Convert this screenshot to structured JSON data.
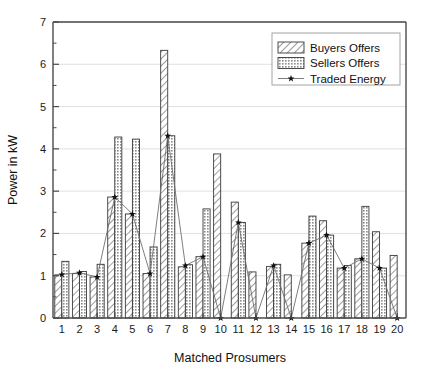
{
  "chart_data": {
    "type": "bar",
    "title": "",
    "subtitle": "",
    "xlabel": "Matched Prosumers",
    "ylabel": "Power in kW",
    "xlim": [
      0.4,
      20.6
    ],
    "ylim": [
      0,
      7
    ],
    "yticks": [
      0,
      1,
      2,
      3,
      4,
      5,
      6,
      7
    ],
    "ytick_labels": [
      "0",
      "1",
      "2",
      "3",
      "4",
      "5",
      "6",
      "7"
    ],
    "ytick_minor_step": 0.5,
    "grid": "horizontal-major-light",
    "legend_position": "top-right",
    "categories": [
      "1",
      "2",
      "3",
      "4",
      "5",
      "6",
      "7",
      "8",
      "9",
      "10",
      "11",
      "12",
      "13",
      "14",
      "15",
      "16",
      "17",
      "18",
      "19",
      "20"
    ],
    "series": [
      {
        "name": "Buyers Offers",
        "kind": "bar",
        "pattern": "diagonal-hatch",
        "fill": "#ffffff",
        "edge": "#3a3a3a",
        "values": [
          1.02,
          1.05,
          0.97,
          2.86,
          2.46,
          1.05,
          6.33,
          1.21,
          1.45,
          3.88,
          2.74,
          1.09,
          1.22,
          1.02,
          1.77,
          2.3,
          1.18,
          1.4,
          2.04,
          1.48
        ]
      },
      {
        "name": "Sellers Offers",
        "kind": "bar",
        "pattern": "cross-dot-hatch",
        "fill": "#c9c9c9",
        "edge": "#3a3a3a",
        "values": [
          1.34,
          1.1,
          1.27,
          4.28,
          4.23,
          1.68,
          4.31,
          1.26,
          2.58,
          0,
          2.26,
          0,
          1.27,
          0,
          2.41,
          1.96,
          1.24,
          2.64,
          1.18,
          0
        ]
      },
      {
        "name": "Traded Energy",
        "kind": "line-marker",
        "marker": "star",
        "color": "#6f6f6f",
        "marker_color": "#111111",
        "values": [
          1.03,
          1.07,
          0.97,
          2.86,
          2.46,
          1.05,
          4.31,
          1.24,
          1.45,
          0,
          2.26,
          0,
          1.24,
          0,
          1.77,
          1.96,
          1.18,
          1.4,
          1.18,
          0
        ]
      }
    ],
    "legend_entries": [
      {
        "label": "Buyers Offers",
        "swatch": "diagonal-hatch"
      },
      {
        "label": "Sellers Offers",
        "swatch": "cross-dot-hatch"
      },
      {
        "label": "Traded Energy",
        "swatch": "line-star"
      }
    ],
    "colors": {
      "axis": "#4a4a4a",
      "grid": "#d8d8d8",
      "bar_edge": "#3a3a3a",
      "sellers_fill": "#c9c9c9",
      "buyers_fill": "#ffffff",
      "traded_line": "#6f6f6f",
      "marker": "#111111",
      "text": "#111111"
    }
  }
}
